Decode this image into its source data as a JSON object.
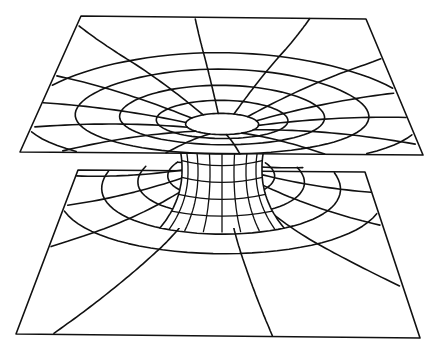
{
  "figure": {
    "line_color": "#111111",
    "background_color": "#ffffff",
    "upper_sheet": {
      "corners": [
        [
          81,
          16
        ],
        [
          366,
          19
        ],
        [
          423,
          155
        ],
        [
          20,
          152
        ]
      ],
      "funnel_center": [
        222,
        110
      ],
      "rings": 5
    },
    "lower_sheet": {
      "corners": [
        [
          78,
          170
        ],
        [
          365,
          172
        ],
        [
          420,
          338
        ],
        [
          16,
          334
        ]
      ],
      "funnel_center": [
        222,
        180
      ],
      "rings": 5
    },
    "throat": {
      "top_y": 155,
      "bottom_y": 172,
      "half_width": 40
    }
  },
  "caption": ""
}
